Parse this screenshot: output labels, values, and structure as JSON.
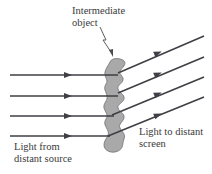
{
  "diagram": {
    "type": "optics-ray-diagram",
    "colors": {
      "ray": "#3f3f45",
      "object_fill": "#a9a9a9",
      "object_stroke": "#6e6e6e",
      "text": "#3a3a3a",
      "background": "#ffffff"
    },
    "labels": {
      "object_line1": "Intermediate",
      "object_line2": "object",
      "outgoing_line1": "Light to distant",
      "outgoing_line2": "screen",
      "incoming_line1": "Light from",
      "incoming_line2": "distant source"
    },
    "incoming_rays": [
      {
        "y": 75
      },
      {
        "y": 96
      },
      {
        "y": 116
      },
      {
        "y": 136
      }
    ],
    "outgoing_rays": [
      {
        "y_start": 73,
        "y_end": 36
      },
      {
        "y_start": 93,
        "y_end": 57
      },
      {
        "y_start": 113,
        "y_end": 77
      },
      {
        "y_start": 133,
        "y_end": 97
      }
    ]
  }
}
